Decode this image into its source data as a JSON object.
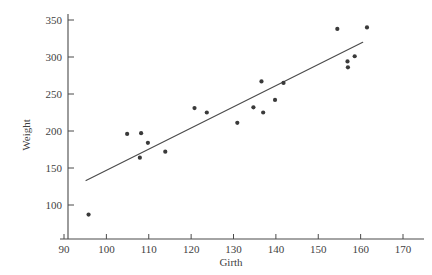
{
  "chart_data": {
    "type": "scatter",
    "title": "",
    "subtitle": "",
    "xlabel": "Girth",
    "ylabel": "Weight",
    "xlim": [
      88,
      172
    ],
    "ylim": [
      78,
      358
    ],
    "grid": false,
    "legend": null,
    "legend_position": "none",
    "xticks": [
      90,
      100,
      110,
      120,
      130,
      140,
      150,
      160,
      170
    ],
    "yticks": [
      100,
      150,
      200,
      250,
      300,
      350
    ],
    "xtick_labels": [
      "90",
      "100",
      "110",
      "120",
      "130",
      "140",
      "150",
      "160",
      "170"
    ],
    "ytick_labels": [
      "100",
      "150",
      "200",
      "250",
      "300",
      "350"
    ],
    "marker": "filled-square-dot",
    "marker_color": "#3a3a3a",
    "points": [
      {
        "x": 95.8,
        "y": 87
      },
      {
        "x": 104.9,
        "y": 196
      },
      {
        "x": 107.9,
        "y": 164
      },
      {
        "x": 108.2,
        "y": 197
      },
      {
        "x": 109.8,
        "y": 184
      },
      {
        "x": 113.9,
        "y": 172
      },
      {
        "x": 120.8,
        "y": 231
      },
      {
        "x": 123.7,
        "y": 225
      },
      {
        "x": 130.9,
        "y": 211
      },
      {
        "x": 134.7,
        "y": 232
      },
      {
        "x": 136.6,
        "y": 267
      },
      {
        "x": 137.0,
        "y": 225
      },
      {
        "x": 139.8,
        "y": 242
      },
      {
        "x": 141.8,
        "y": 265
      },
      {
        "x": 154.5,
        "y": 338
      },
      {
        "x": 156.9,
        "y": 294
      },
      {
        "x": 157.0,
        "y": 286
      },
      {
        "x": 158.6,
        "y": 301
      },
      {
        "x": 161.5,
        "y": 340
      }
    ],
    "fit_line": {
      "name": "least-squares regression line",
      "color": "#4a4a4a",
      "x_start": 95.2,
      "y_start": 133,
      "x_end": 160.5,
      "y_end": 320
    }
  },
  "axes": {
    "x_title": "Girth",
    "y_title": "Weight"
  }
}
